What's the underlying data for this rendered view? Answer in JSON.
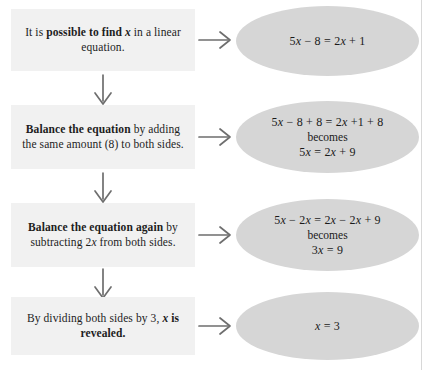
{
  "diagram": {
    "colors": {
      "box_background": "#f1f1f1",
      "ellipse_background": "#d6d6d6",
      "text": "#1d1d1d",
      "arrow": "#6e6e6e",
      "rule": "#d8d8d8"
    },
    "steps": [
      {
        "id": "step-1",
        "text_parts": [
          {
            "text": "It is ",
            "bold": false,
            "italic": false
          },
          {
            "text": "possible to find ",
            "bold": true,
            "italic": false
          },
          {
            "text": "x",
            "bold": true,
            "italic": true
          },
          {
            "text": " in a linear equation.",
            "bold": false,
            "italic": false
          }
        ],
        "plain_text": "It is possible to find x in a linear equation.",
        "equation_lines": [
          {
            "text": "5x − 8 = 2x + 1",
            "style": "equation"
          }
        ]
      },
      {
        "id": "step-2",
        "text_parts": [
          {
            "text": "Balance the equation",
            "bold": true,
            "italic": false
          },
          {
            "text": " by adding the same amount (8) to both sides.",
            "bold": false,
            "italic": false
          }
        ],
        "plain_text": "Balance the equation by adding the same amount (8) to both sides.",
        "equation_lines": [
          {
            "text": "5x − 8 + 8 = 2x +1 + 8",
            "style": "equation"
          },
          {
            "text": "becomes",
            "style": "connector"
          },
          {
            "text": "5x = 2x + 9",
            "style": "equation"
          }
        ]
      },
      {
        "id": "step-3",
        "text_parts": [
          {
            "text": "Balance the equation again",
            "bold": true,
            "italic": false
          },
          {
            "text": " by subtracting 2",
            "bold": false,
            "italic": false
          },
          {
            "text": "x",
            "bold": false,
            "italic": true
          },
          {
            "text": " from both sides.",
            "bold": false,
            "italic": false
          }
        ],
        "plain_text": "Balance the equation again by subtracting 2x from both sides.",
        "equation_lines": [
          {
            "text": "5x − 2x = 2x − 2x + 9",
            "style": "equation"
          },
          {
            "text": "becomes",
            "style": "connector"
          },
          {
            "text": "3x = 9",
            "style": "equation"
          }
        ]
      },
      {
        "id": "step-4",
        "text_parts": [
          {
            "text": "By dividing both sides by 3, ",
            "bold": false,
            "italic": false
          },
          {
            "text": "x",
            "bold": true,
            "italic": true
          },
          {
            "text": " is revealed.",
            "bold": true,
            "italic": false
          }
        ],
        "plain_text": "By dividing both sides by 3, x is revealed.",
        "equation_lines": [
          {
            "text": "x = 3",
            "style": "equation"
          }
        ]
      }
    ],
    "arrows": {
      "right_label": "leads to",
      "down_label": "next step",
      "down_count": 3,
      "right_count": 4
    }
  }
}
